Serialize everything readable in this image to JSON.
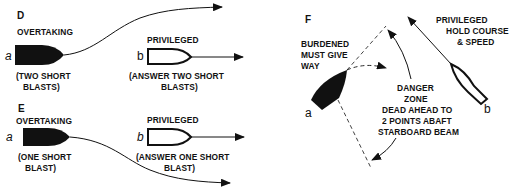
{
  "panels": {
    "D": {
      "letter": "D",
      "overtaking_label": "OVERTAKING",
      "vessel_a_letter": "a",
      "vessel_a_signal_line1": "(TWO SHORT",
      "vessel_a_signal_line2": "BLASTS)",
      "privileged_label": "PRIVILEGED",
      "vessel_b_letter": "b",
      "vessel_b_signal_line1": "(ANSWER TWO SHORT",
      "vessel_b_signal_line2": "BLASTS)"
    },
    "E": {
      "letter": "E",
      "overtaking_label": "OVERTAKING",
      "vessel_a_letter": "a",
      "vessel_a_signal_line1": "(ONE SHORT",
      "vessel_a_signal_line2": "BLAST)",
      "privileged_label": "PRIVILEGED",
      "vessel_b_letter": "b",
      "vessel_b_signal_line1": "(ANSWER ONE SHORT",
      "vessel_b_signal_line2": "BLAST)"
    },
    "F": {
      "letter": "F",
      "burdened_line1": "BURDENED",
      "burdened_line2": "MUST GIVE",
      "burdened_line3": "WAY",
      "privileged_line1": "PRIVILEGED",
      "privileged_line2": "HOLD COURSE",
      "privileged_line3": "& SPEED",
      "danger_line1": "DANGER",
      "danger_line2": "ZONE",
      "danger_line3": "DEAD AHEAD TO",
      "danger_line4": "2 POINTS ABAFT",
      "danger_line5": "STARBOARD BEAM",
      "vessel_a_letter": "a",
      "vessel_b_letter": "b"
    }
  },
  "colors": {
    "ink": "#111111",
    "background": "#ffffff"
  }
}
